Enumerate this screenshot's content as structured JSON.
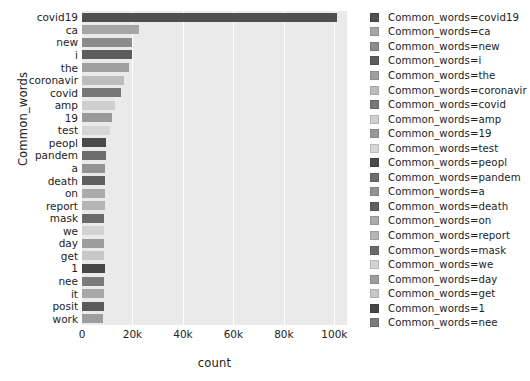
{
  "chart_data": {
    "type": "bar",
    "orientation": "horizontal",
    "title": "",
    "xlabel": "count",
    "ylabel": "Common_words",
    "xlim": [
      0,
      105000
    ],
    "ylim": [
      0,
      24
    ],
    "grid": true,
    "grid_axis": "x",
    "legend_position": "right",
    "legend_title": "",
    "xticks": [
      0,
      20000,
      40000,
      60000,
      80000,
      100000
    ],
    "xticklabels": [
      "0",
      "20k",
      "40k",
      "60k",
      "80k",
      "100k"
    ],
    "categories": [
      "covid19",
      "ca",
      "new",
      "i",
      "the",
      "coronavir",
      "covid",
      "amp",
      "19",
      "test",
      "peopl",
      "pandem",
      "a",
      "death",
      "on",
      "report",
      "mask",
      "we",
      "day",
      "get",
      "1",
      "nee",
      "it",
      "posit",
      "work"
    ],
    "values": [
      101000,
      22400,
      20000,
      20000,
      18600,
      16800,
      15600,
      13200,
      12000,
      11200,
      9600,
      9400,
      9300,
      9200,
      9100,
      9000,
      8900,
      8800,
      8700,
      8600,
      9000,
      8900,
      8700,
      8600,
      8500
    ],
    "bar_colors": [
      "#4f4f4f",
      "#a6a6a6",
      "#8b8b8b",
      "#5c5c5c",
      "#a0a0a0",
      "#bdbdbd",
      "#777777",
      "#cfcfcf",
      "#9a9a9a",
      "#d6d6d6",
      "#4a4a4a",
      "#6d6d6d",
      "#939393",
      "#5f5f5f",
      "#ababab",
      "#b5b5b5",
      "#6a6a6a",
      "#d2d2d2",
      "#9d9d9d",
      "#c8c8c8",
      "#474747",
      "#7b7b7b",
      "#a8a8a8",
      "#5a5a5a",
      "#9e9e9e"
    ],
    "plot_bg": "#eaeaea",
    "grid_color": "#ffffff",
    "figure_bg": "#ffffff"
  },
  "legend": {
    "entries": [
      {
        "label": "Common_words=covid19",
        "color": "#4f4f4f"
      },
      {
        "label": "Common_words=ca",
        "color": "#a6a6a6"
      },
      {
        "label": "Common_words=new",
        "color": "#8b8b8b"
      },
      {
        "label": "Common_words=i",
        "color": "#5c5c5c"
      },
      {
        "label": "Common_words=the",
        "color": "#a0a0a0"
      },
      {
        "label": "Common_words=coronavir",
        "color": "#bdbdbd"
      },
      {
        "label": "Common_words=covid",
        "color": "#777777"
      },
      {
        "label": "Common_words=amp",
        "color": "#cfcfcf"
      },
      {
        "label": "Common_words=19",
        "color": "#9a9a9a"
      },
      {
        "label": "Common_words=test",
        "color": "#d6d6d6"
      },
      {
        "label": "Common_words=peopl",
        "color": "#4a4a4a"
      },
      {
        "label": "Common_words=pandem",
        "color": "#6d6d6d"
      },
      {
        "label": "Common_words=a",
        "color": "#939393"
      },
      {
        "label": "Common_words=death",
        "color": "#5f5f5f"
      },
      {
        "label": "Common_words=on",
        "color": "#ababab"
      },
      {
        "label": "Common_words=report",
        "color": "#b5b5b5"
      },
      {
        "label": "Common_words=mask",
        "color": "#6a6a6a"
      },
      {
        "label": "Common_words=we",
        "color": "#d2d2d2"
      },
      {
        "label": "Common_words=day",
        "color": "#9d9d9d"
      },
      {
        "label": "Common_words=get",
        "color": "#c8c8c8"
      },
      {
        "label": "Common_words=1",
        "color": "#474747"
      },
      {
        "label": "Common_words=nee",
        "color": "#7b7b7b"
      }
    ]
  }
}
